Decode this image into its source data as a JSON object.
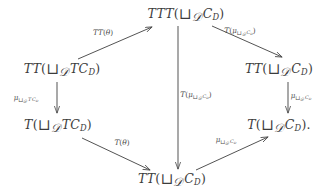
{
  "diagram": {
    "type": "commutative-diagram",
    "background_color": "#ffffff",
    "ink_color": "#3f3f3f",
    "nodes": [
      {
        "id": "top",
        "label": "TTT(⊔_𝒟 C_D)",
        "x": 186,
        "y": 15
      },
      {
        "id": "left-upper",
        "label": "TT(⊔_𝒟 TC_D)",
        "x": 62,
        "y": 70
      },
      {
        "id": "right-upper",
        "label": "TT(⊔_𝒟 C_D)",
        "x": 279,
        "y": 70
      },
      {
        "id": "left-lower",
        "label": "T(⊔_𝒟 TC_D)",
        "x": 58,
        "y": 126
      },
      {
        "id": "right-lower",
        "label": "T(⊔_𝒟 C_D).",
        "x": 279,
        "y": 126
      },
      {
        "id": "bottom",
        "label": "TT(⊔_𝒟 C_D)",
        "x": 172,
        "y": 180
      }
    ],
    "arrows": [
      {
        "id": "left-upper-to-top",
        "from": "left-upper",
        "to": "top",
        "label": "TT(θ)",
        "label_x": 103,
        "label_y": 33
      },
      {
        "id": "top-to-right-upper",
        "from": "top",
        "to": "right-upper",
        "label": "T(μ_⊔_𝒟 C_D)",
        "label_x": 240,
        "label_y": 32
      },
      {
        "id": "left-upper-to-left-lower",
        "from": "left-upper",
        "to": "left-lower",
        "label": "μ_⊔_𝒟 TC_D",
        "label_x": 26,
        "label_y": 99
      },
      {
        "id": "top-to-bottom",
        "from": "top",
        "to": "bottom",
        "label": "T(μ_⊔_𝒟 C_D)",
        "label_x": 196,
        "label_y": 96
      },
      {
        "id": "right-upper-to-right-lower",
        "from": "right-upper",
        "to": "right-lower",
        "label": "μ_⊔_𝒟 C_D",
        "label_x": 301,
        "label_y": 97
      },
      {
        "id": "left-lower-to-bottom",
        "from": "left-lower",
        "to": "bottom",
        "label": "T(θ)",
        "label_x": 122,
        "label_y": 143
      },
      {
        "id": "bottom-to-right-lower",
        "from": "bottom",
        "to": "right-lower",
        "label": "μ_⊔_𝒟 C_D",
        "label_x": 226,
        "label_y": 141
      }
    ]
  }
}
